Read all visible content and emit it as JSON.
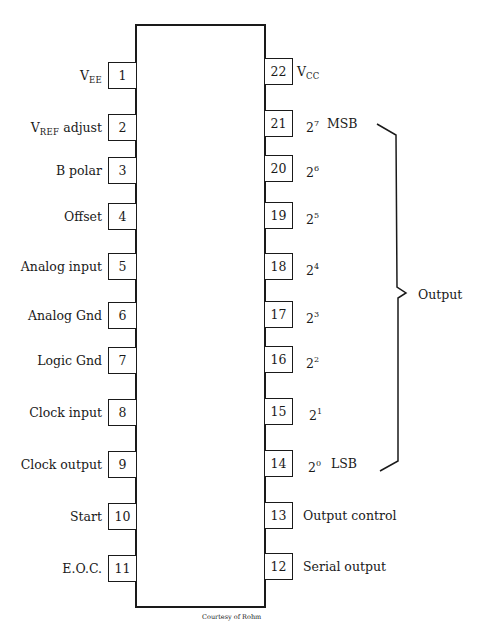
{
  "diagram": {
    "type": "IC pinout",
    "caption": "Courtesy of Rohm",
    "output_group_label": "Output",
    "left_pins": [
      {
        "num": "1",
        "label": "V",
        "sub": "EE",
        "suffix": ""
      },
      {
        "num": "2",
        "label": "V",
        "sub": "REF",
        "suffix": " adjust"
      },
      {
        "num": "3",
        "label": "B polar"
      },
      {
        "num": "4",
        "label": "Offset"
      },
      {
        "num": "5",
        "label": "Analog input"
      },
      {
        "num": "6",
        "label": "Analog Gnd"
      },
      {
        "num": "7",
        "label": "Logic Gnd"
      },
      {
        "num": "8",
        "label": "Clock input"
      },
      {
        "num": "9",
        "label": "Clock output"
      },
      {
        "num": "10",
        "label": "Start"
      },
      {
        "num": "11",
        "label": "E.O.C."
      }
    ],
    "right_pins": [
      {
        "num": "22",
        "label": "V",
        "sub": "CC"
      },
      {
        "num": "21",
        "base": "2",
        "exp": "7",
        "tag": "MSB"
      },
      {
        "num": "20",
        "base": "2",
        "exp": "6"
      },
      {
        "num": "19",
        "base": "2",
        "exp": "5"
      },
      {
        "num": "18",
        "base": "2",
        "exp": "4"
      },
      {
        "num": "17",
        "base": "2",
        "exp": "3"
      },
      {
        "num": "16",
        "base": "2",
        "exp": "2"
      },
      {
        "num": "15",
        "base": "2",
        "exp": "1"
      },
      {
        "num": "14",
        "base": "2",
        "exp": "0",
        "tag": "LSB"
      },
      {
        "num": "13",
        "label": "Output control"
      },
      {
        "num": "12",
        "label": "Serial output"
      }
    ]
  }
}
